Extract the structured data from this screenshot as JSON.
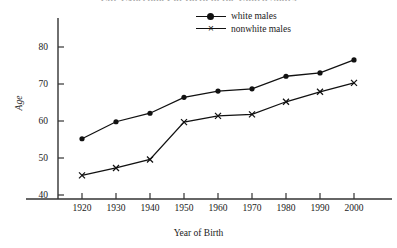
{
  "chart_data": {
    "type": "line",
    "title": "Life Expectancy at Birth in the United States",
    "title_visible": false,
    "xlabel": "Year of Birth",
    "ylabel": "Age",
    "x": [
      1920,
      1930,
      1940,
      1950,
      1960,
      1970,
      1980,
      1990,
      2000
    ],
    "xtick_labels": [
      "1920",
      "1930",
      "1940",
      "1950",
      "1960",
      "1970",
      "1980",
      "1990",
      "2000"
    ],
    "ytick_labels": [
      "40",
      "50",
      "60",
      "70",
      "80"
    ],
    "yticks": [
      40,
      50,
      60,
      70,
      80
    ],
    "xlim": [
      1915,
      2005
    ],
    "ylim": [
      37,
      84
    ],
    "grid": false,
    "legend_position": "top-right",
    "series": [
      {
        "name": "white males",
        "marker": "filled-circle",
        "color": "#111111",
        "values": [
          55.2,
          59.8,
          62.1,
          66.4,
          68.1,
          68.7,
          72.1,
          73.0,
          76.5
        ]
      },
      {
        "name": "nonwhite males",
        "marker": "cross",
        "color": "#111111",
        "values": [
          45.3,
          47.3,
          49.6,
          59.7,
          61.4,
          61.8,
          65.2,
          67.9,
          70.3
        ]
      }
    ]
  },
  "legend": {
    "items": [
      {
        "label": "white males",
        "marker": "filled-circle"
      },
      {
        "label": "nonwhite males",
        "marker": "cross"
      }
    ]
  },
  "axes": {
    "y_title": "Age",
    "x_title": "Year of Birth"
  }
}
